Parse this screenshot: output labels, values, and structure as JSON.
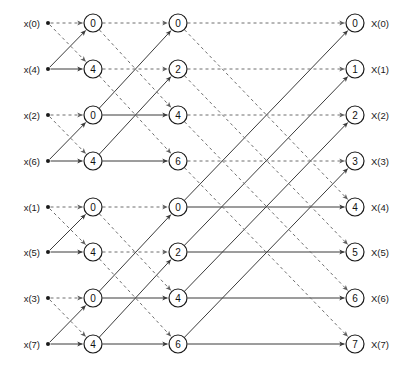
{
  "figure": {
    "type": "signal-flow-graph",
    "name": "8-point radix-2 decimation-in-time FFT butterfly diagram",
    "width": 405,
    "height": 374,
    "background": "#ffffff",
    "solid_edge_color": "#3b3b3b",
    "dashed_edge_color": "#6e6e6e",
    "node_stroke_color": "#1a1a1a",
    "text_color": "#1a1a1a",
    "caption": ""
  },
  "geometry": {
    "rows_y": [
      23,
      69,
      115,
      161,
      207,
      252,
      298,
      344
    ],
    "input_dot_x": 48,
    "stage_x": [
      93,
      178,
      355
    ],
    "input_label_x": 40,
    "output_label_x": 371,
    "node_radius": 9
  },
  "inputs": {
    "labels": [
      "x(0)",
      "x(4)",
      "x(2)",
      "x(6)",
      "x(1)",
      "x(5)",
      "x(3)",
      "x(7)"
    ]
  },
  "outputs": {
    "labels": [
      "X(0)",
      "X(1)",
      "X(2)",
      "X(3)",
      "X(4)",
      "X(5)",
      "X(6)",
      "X(7)"
    ]
  },
  "stages": [
    {
      "index": 1,
      "name": "stage-1",
      "span": 1,
      "node_values": [
        "0",
        "4",
        "0",
        "4",
        "0",
        "4",
        "0",
        "4"
      ]
    },
    {
      "index": 2,
      "name": "stage-2",
      "span": 2,
      "node_values": [
        "0",
        "2",
        "4",
        "6",
        "0",
        "2",
        "4",
        "6"
      ]
    },
    {
      "index": 3,
      "name": "stage-3",
      "span": 4,
      "node_values": [
        "0",
        "1",
        "2",
        "3",
        "4",
        "5",
        "6",
        "7"
      ]
    }
  ],
  "chart_data": {
    "type": "diagram",
    "inputs": [
      "x(0)",
      "x(4)",
      "x(2)",
      "x(6)",
      "x(1)",
      "x(5)",
      "x(3)",
      "x(7)"
    ],
    "outputs": [
      "X(0)",
      "X(1)",
      "X(2)",
      "X(3)",
      "X(4)",
      "X(5)",
      "X(6)",
      "X(7)"
    ],
    "stage_twiddle_indices": [
      [
        0,
        4,
        0,
        4,
        0,
        4,
        0,
        4
      ],
      [
        0,
        2,
        4,
        6,
        0,
        2,
        4,
        6
      ],
      [
        0,
        1,
        2,
        3,
        4,
        5,
        6,
        7
      ]
    ],
    "edge_styles": {
      "straight_through": "solid",
      "cross_over": "dashed-and-solid"
    },
    "butterfly_spans": [
      1,
      2,
      4
    ]
  }
}
